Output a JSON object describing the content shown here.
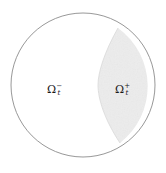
{
  "figure": {
    "name": "domain-decomposition-circle",
    "width": 166,
    "height": 173,
    "background_color": "#ffffff"
  },
  "outer_boundary": {
    "shape": "circle",
    "center_x": 83,
    "center_y": 85,
    "radius": 72,
    "stroke_color": "#8c8c8c",
    "stroke_width": 0.9,
    "fill_color": "none"
  },
  "shaded_region": {
    "shape": "lens",
    "fill_color": "#ececec",
    "stroke_color": "none",
    "top_vertex_x": 118,
    "top_vertex_y": 28,
    "bottom_vertex_x": 120,
    "bottom_vertex_y": 143,
    "leftmost_x": 98,
    "leftmost_y": 85
  },
  "interface_curve": {
    "name": "free-interface",
    "stroke_color": "#d8d8d8"
  },
  "labels": {
    "left": {
      "name": "omega-minus-label",
      "symbol": "Ω",
      "superscript": "−",
      "subscript": "t",
      "full_text": "Ω−t",
      "center_x": 56,
      "center_y": 89,
      "color": "#1a1a1a"
    },
    "right": {
      "name": "omega-plus-label",
      "symbol": "Ω",
      "superscript": "+",
      "subscript": "t",
      "full_text": "Ω+t",
      "center_x": 124,
      "center_y": 89,
      "color": "#1a1a1a"
    }
  }
}
